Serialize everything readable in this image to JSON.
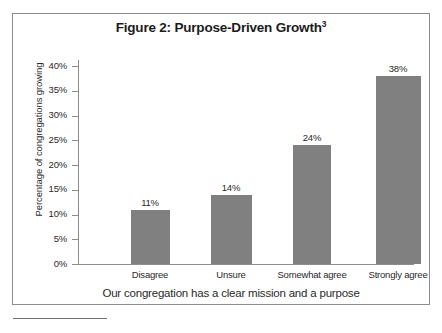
{
  "figure": {
    "title_main": "Figure 2: Purpose-Driven Growth",
    "title_superscript": "3",
    "footnote_rule": "footnote-separator"
  },
  "chart_data": {
    "type": "bar",
    "title": "Figure 2: Purpose-Driven Growth",
    "categories": [
      "Disagree",
      "Unsure",
      "Somewhat agree",
      "Strongly agree"
    ],
    "values": [
      11,
      14,
      24,
      38
    ],
    "value_labels": [
      "11%",
      "14%",
      "24%",
      "38%"
    ],
    "xlabel": "Our congregation has a clear mission and a purpose",
    "ylabel": "Percentage of congregations growing",
    "ylim": [
      0,
      40
    ],
    "ytick_values": [
      40,
      35,
      30,
      25,
      20,
      15,
      10,
      5,
      0
    ],
    "ytick_labels": [
      "40%",
      "35%",
      "30%",
      "25%",
      "20%",
      "15%",
      "10%",
      "5%",
      "0%"
    ],
    "grid": false,
    "legend": "none",
    "bar_color": "#808080",
    "axis_color": "#8d8d8d",
    "text_color": "#2a2a2a",
    "background": "#ffffff"
  }
}
